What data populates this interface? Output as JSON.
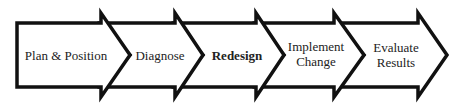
{
  "diagram": {
    "type": "process-chevron-flow",
    "steps": [
      {
        "label": "Plan & Position",
        "bold": false
      },
      {
        "label": "Diagnose",
        "bold": false
      },
      {
        "label": "Redesign",
        "bold": true
      },
      {
        "label": "Implement\nChange",
        "line1": "Implement",
        "line2": "Change",
        "bold": false
      },
      {
        "label": "Evaluate\nResults",
        "line1": "Evaluate",
        "line2": "Results",
        "bold": false
      }
    ],
    "colors": {
      "stroke": "#111111",
      "fill": "#ffffff",
      "text": "#222222"
    }
  }
}
